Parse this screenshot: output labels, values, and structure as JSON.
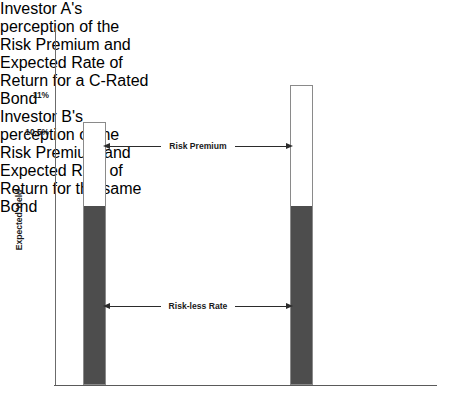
{
  "chart_data": {
    "type": "bar",
    "title": "",
    "xlabel": "",
    "ylabel": "Expected Yield",
    "categories": [
      "Investor A's perception of the Risk Premium and Expected Rate of Return for a C-Rated Bond",
      "Investor B's perception of the Risk Premium and Expected Rate of Return for the same Bond"
    ],
    "series": [
      {
        "name": "Risk-less Rate",
        "values": [
          7.0,
          7.0
        ],
        "color": "#4d4d4d"
      },
      {
        "name": "Risk Premium",
        "values": [
          3.5,
          4.0
        ],
        "color": "#ffffff"
      }
    ],
    "totals": [
      10.5,
      11.0
    ],
    "ytick_labels": [
      "11%",
      "10.5%"
    ],
    "ytick_values": [
      11,
      10.5
    ],
    "grid": false,
    "legend_position": "none",
    "annotations": [
      "Risk Premium",
      "Risk-less Rate"
    ]
  },
  "headings": {
    "left": "Investor A's perception of the Risk Premium and Expected Rate of Return for a C-Rated Bond",
    "right": "Investor B's perception of the Risk Premium and Expected Rate of Return for the same Bond"
  },
  "axis": {
    "y_title": "Expected Yield",
    "ticks": {
      "upper": "11%",
      "lower": "10.5%"
    }
  },
  "annotations": {
    "risk_premium": "Risk Premium",
    "riskless_rate": "Risk-less Rate"
  },
  "colors": {
    "riskless_fill": "#4d4d4d",
    "premium_fill": "#ffffff",
    "bar_border": "#8a8a8a",
    "axis": "#5a5a5a",
    "text": "#1a1a1a"
  }
}
